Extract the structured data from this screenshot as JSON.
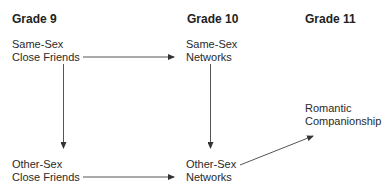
{
  "headers": [
    {
      "label": "Grade 9"
    },
    {
      "label": "Grade 10"
    },
    {
      "label": "Grade 11"
    }
  ],
  "nodes": {
    "same_sex_close_friends": {
      "line1": "Same-Sex",
      "line2": "Close Friends"
    },
    "same_sex_networks": {
      "line1": "Same-Sex",
      "line2": "Networks"
    },
    "other_sex_close_friends": {
      "line1": "Other-Sex",
      "line2": "Close Friends"
    },
    "other_sex_networks": {
      "line1": "Other-Sex",
      "line2": "Networks"
    },
    "romantic_companionship": {
      "line1": "Romantic",
      "line2": "Companionship"
    }
  },
  "edges": [
    {
      "from": "Same-Sex Close Friends",
      "to": "Same-Sex Networks"
    },
    {
      "from": "Same-Sex Close Friends",
      "to": "Other-Sex Close Friends"
    },
    {
      "from": "Same-Sex Networks",
      "to": "Other-Sex Networks"
    },
    {
      "from": "Other-Sex Close Friends",
      "to": "Other-Sex Networks"
    },
    {
      "from": "Other-Sex Networks",
      "to": "Romantic Companionship"
    }
  ],
  "colors": {
    "line": "#555555",
    "text": "#2a2a2a"
  }
}
